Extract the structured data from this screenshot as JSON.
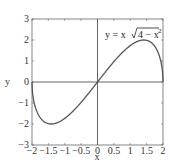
{
  "chart_data": {
    "type": "line",
    "title": "",
    "xlabel": "x",
    "ylabel": "y",
    "xlim": [
      -2,
      2
    ],
    "ylim": [
      -3,
      3
    ],
    "grid": false,
    "xticks": [
      -2,
      -1.5,
      -1,
      -0.5,
      0,
      0.5,
      1,
      1.5,
      2
    ],
    "xtick_labels": [
      "−2",
      "−1.5",
      "−1",
      "−0.5",
      "0",
      "0.5",
      "1",
      "1.5",
      "2"
    ],
    "yticks": [
      -3,
      -2,
      -1,
      0,
      1,
      2,
      3
    ],
    "ytick_labels": [
      "−3",
      "−2",
      "−1",
      "0",
      "1",
      "2",
      "3"
    ],
    "annotation": {
      "text_prefix": "y = x",
      "radicand": "4 − x",
      "exponent": "2"
    },
    "series": [
      {
        "name": "y = x√(4 − x²)",
        "x": [
          -2,
          -1.99,
          -1.95,
          -1.9,
          -1.8,
          -1.7,
          -1.6,
          -1.5,
          -1.414,
          -1.3,
          -1.2,
          -1.1,
          -1.0,
          -0.8,
          -0.6,
          -0.4,
          -0.2,
          0,
          0.2,
          0.4,
          0.6,
          0.8,
          1.0,
          1.1,
          1.2,
          1.3,
          1.414,
          1.5,
          1.6,
          1.7,
          1.8,
          1.9,
          1.95,
          1.99,
          2
        ],
        "values": [
          0,
          -0.398,
          -0.866,
          -1.187,
          -1.569,
          -1.791,
          -1.92,
          -1.984,
          -2.0,
          -1.976,
          -1.92,
          -1.837,
          -1.732,
          -1.466,
          -1.145,
          -0.784,
          -0.398,
          0,
          0.398,
          0.784,
          1.145,
          1.466,
          1.732,
          1.837,
          1.92,
          1.976,
          2.0,
          1.984,
          1.92,
          1.791,
          1.569,
          1.187,
          0.866,
          0.398,
          0
        ]
      }
    ],
    "colors": {
      "line": "#555555",
      "axes": "#555555",
      "frame": "#666666"
    }
  }
}
